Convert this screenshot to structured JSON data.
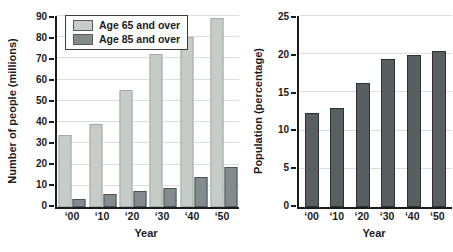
{
  "figure": {
    "background": "#ffffff"
  },
  "chart_data": [
    {
      "id": "people-millions",
      "type": "bar",
      "title": "",
      "xlabel": "Year",
      "ylabel": "Number of people (millions)",
      "categories": [
        "‘00",
        "‘10",
        "‘20",
        "‘30",
        "‘40",
        "‘50"
      ],
      "ylim": [
        0,
        90
      ],
      "ystep": 10,
      "grid": true,
      "legend": true,
      "legend_position": "top-left-inside",
      "series": [
        {
          "name": "Age 65 and over",
          "color": "#c6ccc7",
          "edge": "#a3aba5",
          "values": [
            34,
            39,
            55,
            72,
            80,
            89
          ]
        },
        {
          "name": "Age 85 and over",
          "color": "#828c8e",
          "edge": "#4d5456",
          "values": [
            4,
            6,
            7.5,
            9,
            14,
            19
          ]
        }
      ]
    },
    {
      "id": "population-percentage",
      "type": "bar",
      "title": "",
      "xlabel": "Year",
      "ylabel": "Population (percentage)",
      "categories": [
        "‘00",
        "‘10",
        "‘20",
        "‘30",
        "‘40",
        "‘50"
      ],
      "ylim": [
        0,
        25
      ],
      "ystep": 5,
      "grid": true,
      "legend": false,
      "series": [
        {
          "name": "Percent age 65 and over",
          "color": "#585fPLACEHOLDER",
          "edge": "#2c3134",
          "values": [
            12.3,
            13,
            16.2,
            19.4,
            19.9,
            20.4
          ]
        }
      ]
    }
  ],
  "colors": {
    "axis": "#1c1c1c",
    "grid": "#dbdfdc",
    "text": "#1c1c1c",
    "legend_border": "#3c3c3c",
    "legend_bg": "#ffffff",
    "right_bar": "#575f62"
  }
}
